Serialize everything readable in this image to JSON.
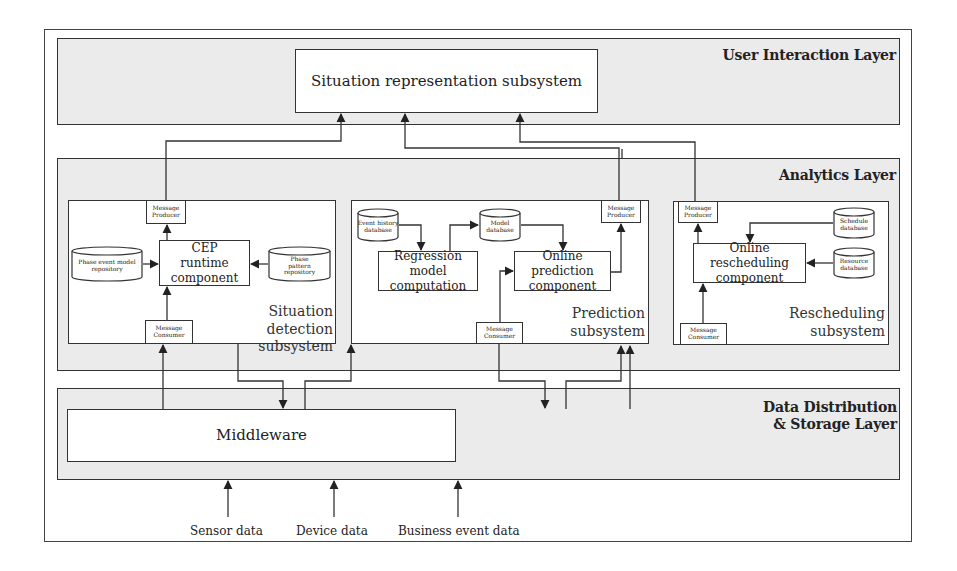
{
  "layers": {
    "user_interaction": {
      "title": "User Interaction Layer",
      "situation_representation": "Situation representation subsystem"
    },
    "analytics": {
      "title": "Analytics Layer",
      "situation_detection": {
        "title_line1": "Situation",
        "title_line2": "detection subsystem",
        "message_producer": "Message Producer",
        "message_consumer": "Message Consumer",
        "cep_runtime": "CEP runtime component",
        "phase_event_repo": "Phase event model repository",
        "phase_pattern_repo": "Phase pattern repository"
      },
      "prediction": {
        "title_line1": "Prediction",
        "title_line2": "subsystem",
        "message_producer": "Message Producer",
        "message_consumer": "Message Consumer",
        "event_history_db": "Event history database",
        "model_db": "Model database",
        "regression": "Regression model computation",
        "online_prediction": "Online prediction component"
      },
      "rescheduling": {
        "title_line1": "Rescheduling",
        "title_line2": "subsystem",
        "message_producer": "Message Producer",
        "message_consumer": "Message Consumer",
        "online_rescheduling": "Online rescheduling component",
        "schedule_db": "Schedule database",
        "resource_db": "Resource database"
      }
    },
    "data_distribution": {
      "title_line1": "Data Distribution",
      "title_line2": "& Storage Layer",
      "middleware": "Middleware"
    }
  },
  "inputs": [
    "Sensor data",
    "Device data",
    "Business event data"
  ]
}
